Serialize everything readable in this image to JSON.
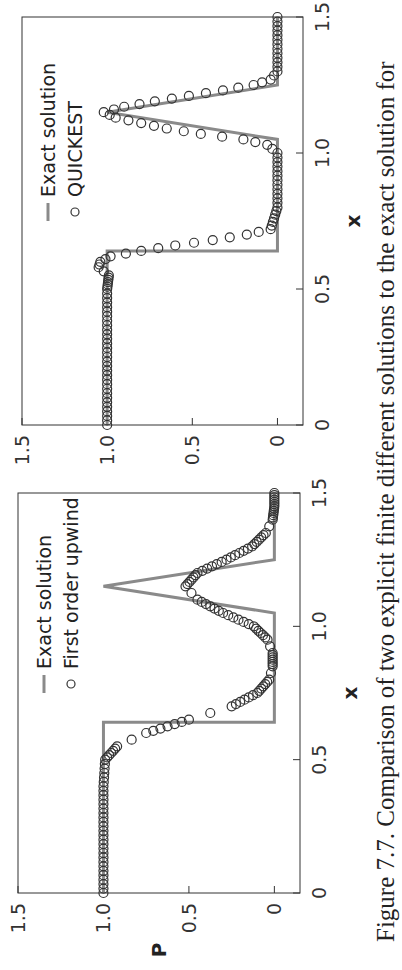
{
  "caption": "Figure 7.7. Comparison of two explicit finite different solutions to the exact solution for",
  "colors": {
    "exact": "#8a8a8a",
    "markers": "#333333",
    "frame": "#333333"
  },
  "chart_data": [
    {
      "type": "line",
      "panel": "left",
      "title": "",
      "xlabel": "x",
      "ylabel": "P",
      "xlim": [
        0,
        1.5
      ],
      "ylim": [
        -0.15,
        1.5
      ],
      "xticks": [
        "0",
        "0.5",
        "1.0",
        "1.5"
      ],
      "yticks": [
        "0",
        "0.5",
        "1.0",
        "1.5"
      ],
      "legend": [
        "Exact solution",
        "First order upwind"
      ],
      "legend_position": "upper right",
      "series": [
        {
          "name": "Exact solution",
          "style": "line",
          "x": [
            0,
            0.64,
            0.64,
            1.05,
            1.05,
            1.15,
            1.25,
            1.25,
            1.5
          ],
          "y": [
            1,
            1,
            0,
            0,
            0,
            1.0,
            0,
            0,
            0
          ]
        },
        {
          "name": "First order upwind",
          "style": "markers",
          "x": [
            0,
            0.1,
            0.2,
            0.3,
            0.4,
            0.5,
            0.55,
            0.6,
            0.65,
            0.7,
            0.75,
            0.8,
            0.85,
            0.9,
            0.95,
            1.0,
            1.05,
            1.1,
            1.15,
            1.2,
            1.25,
            1.3,
            1.35,
            1.4,
            1.45,
            1.5
          ],
          "y": [
            1,
            1,
            1,
            1,
            1,
            0.99,
            0.92,
            0.75,
            0.5,
            0.25,
            0.1,
            0.03,
            0.01,
            0.01,
            0.04,
            0.12,
            0.3,
            0.45,
            0.52,
            0.45,
            0.28,
            0.13,
            0.05,
            0.01,
            0,
            0
          ]
        }
      ]
    },
    {
      "type": "line",
      "panel": "right",
      "title": "",
      "xlabel": "x",
      "ylabel": "",
      "xlim": [
        0,
        1.5
      ],
      "ylim": [
        -0.15,
        1.5
      ],
      "xticks": [
        "0",
        "0.5",
        "1.0",
        "1.5"
      ],
      "yticks": [
        "0",
        "0.5",
        "1.0",
        "1.5"
      ],
      "legend": [
        "Exact solution",
        "QUICKEST"
      ],
      "legend_position": "upper right",
      "series": [
        {
          "name": "Exact solution",
          "style": "line",
          "x": [
            0,
            0.64,
            0.64,
            1.05,
            1.05,
            1.15,
            1.25,
            1.25,
            1.5
          ],
          "y": [
            1,
            1,
            0,
            0,
            0,
            1.0,
            0,
            0,
            0
          ]
        },
        {
          "name": "QUICKEST",
          "style": "markers",
          "x": [
            0,
            0.1,
            0.2,
            0.3,
            0.4,
            0.5,
            0.55,
            0.58,
            0.6,
            0.62,
            0.64,
            0.66,
            0.68,
            0.7,
            0.72,
            0.8,
            0.9,
            1.0,
            1.03,
            1.05,
            1.07,
            1.09,
            1.11,
            1.13,
            1.15,
            1.17,
            1.19,
            1.21,
            1.23,
            1.25,
            1.27,
            1.3,
            1.4,
            1.5
          ],
          "y": [
            1,
            1,
            1,
            1,
            1,
            1,
            0.99,
            1.05,
            1.04,
            0.98,
            0.8,
            0.6,
            0.38,
            0.18,
            0.04,
            0,
            0,
            0,
            0.06,
            0.2,
            0.45,
            0.65,
            0.8,
            0.95,
            1.02,
            0.9,
            0.72,
            0.52,
            0.32,
            0.14,
            0.04,
            0,
            0,
            0
          ]
        }
      ]
    }
  ]
}
